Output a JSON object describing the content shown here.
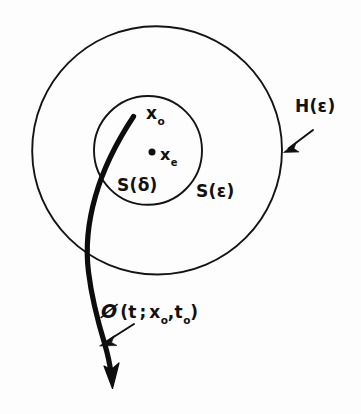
{
  "figure": {
    "background_color": "#fdfdfd",
    "ink_color": "#111111",
    "width": 361,
    "height": 414
  },
  "labels": {
    "initial_state": {
      "base": "x",
      "subscript": "o",
      "full": "x₀",
      "x": 146,
      "y": 103
    },
    "equilibrium_state": {
      "base": "x",
      "subscript": "e",
      "full": "xₑ",
      "x": 160,
      "y": 145
    },
    "inner_ball": {
      "base": "S(",
      "symbol": "δ",
      "close": ")",
      "full": "S(δ)",
      "x": 117,
      "y": 175
    },
    "outer_ball": {
      "base": "S(",
      "symbol": "ε",
      "close": ")",
      "full": "S(ε)",
      "x": 196,
      "y": 181
    },
    "region_h": {
      "base": "H(",
      "symbol": "ε",
      "close": ")",
      "full": "H(ε)",
      "x": 295,
      "y": 96
    },
    "trajectory": {
      "phi": "Ø",
      "open": "(",
      "arg_t": "t",
      "semicolon": ";",
      "arg_x": "x",
      "arg_x_sub": "o",
      "comma": ",",
      "arg_t0": "t",
      "arg_t0_sub": "o",
      "close": ")",
      "full": "Ø(t ; x₀ , t₀)",
      "x": 101,
      "y": 300
    }
  },
  "geometry": {
    "outer_circle": {
      "name": "H(ε) boundary",
      "cx": 157,
      "cy": 150,
      "r": 125,
      "stroke": "#141414",
      "stroke_width": 1.9
    },
    "inner_circle": {
      "name": "S(δ) boundary",
      "cx": 148,
      "cy": 150,
      "r": 54,
      "stroke": "#141414",
      "stroke_width": 1.9
    },
    "equilibrium_point": {
      "cx": 152,
      "cy": 152,
      "r": 3.4,
      "fill": "#101010"
    },
    "trajectory_curve": {
      "start_x": 133,
      "start_y": 116,
      "end_x": 110,
      "end_y": 381,
      "stroke": "#0d0d0d",
      "stroke_width": 5.2
    },
    "pointer_h": {
      "from_x": 313,
      "from_y": 131,
      "to_x": 285,
      "to_y": 151
    },
    "pointer_phi": {
      "from_x": 133,
      "from_y": 325,
      "to_x": 100,
      "to_y": 345
    }
  }
}
